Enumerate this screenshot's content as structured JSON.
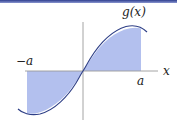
{
  "figure": {
    "function_label": "g(x)",
    "axis_x_label": "x",
    "left_bound_label": "−a",
    "right_bound_label": "a",
    "colors": {
      "top_bar": "#3a4a9a",
      "curve": "#2e3f86",
      "fill": "#aab8ea",
      "axis": "#9a9a9a"
    }
  }
}
